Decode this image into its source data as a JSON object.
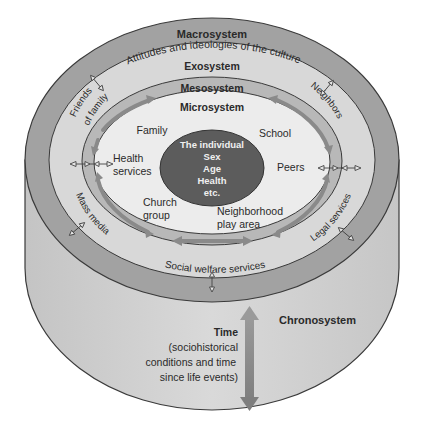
{
  "colors": {
    "background": "#ffffff",
    "cylinder_side": "#cfcfcf",
    "macrosystem_ring": "#9e9e9e",
    "exosystem_ring": "#d6d6d6",
    "mesosystem_ring": "#b4b4b4",
    "microsystem_fill": "#ececec",
    "individual_fill": "#5a5a5a",
    "individual_text": "#f2f2f2",
    "arrow": "#8a8a8a",
    "outline": "#3a3a3a",
    "text": "#2a2a2a"
  },
  "layers": {
    "macrosystem": {
      "label": "Macrosystem",
      "description": "Attitudes and ideologies of the culture"
    },
    "exosystem": {
      "label": "Exosystem",
      "items": [
        "Friends of family",
        "Neighbors",
        "Mass media",
        "Legal services",
        "Social welfare services"
      ]
    },
    "mesosystem": {
      "label": "Mesosystem"
    },
    "microsystem": {
      "label": "Microsystem",
      "items": [
        "Family",
        "School",
        "Health services",
        "Peers",
        "Church group",
        "Neighborhood play area"
      ]
    },
    "individual": {
      "title": "The individual",
      "attributes": [
        "Sex",
        "Age",
        "Health",
        "etc."
      ]
    },
    "chronosystem": {
      "label": "Chronosystem",
      "time_label": "Time",
      "time_description": [
        "(sociohistorical",
        "conditions and time",
        "since life events)"
      ]
    }
  },
  "labels": {
    "friends_line1": "Friends",
    "friends_line2": "of family",
    "neighbors": "Neighbors",
    "mass_media": "Mass media",
    "legal_services": "Legal services",
    "social_welfare": "Social welfare services",
    "family": "Family",
    "school": "School",
    "health_line1": "Health",
    "health_line2": "services",
    "peers": "Peers",
    "church_line1": "Church",
    "church_line2": "group",
    "neighborhood_line1": "Neighborhood",
    "neighborhood_line2": "play area"
  }
}
